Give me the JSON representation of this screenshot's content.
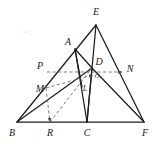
{
  "figure": {
    "width": 161,
    "height": 151,
    "background_color": "#ffffff",
    "stroke_color": "#1c1c1c",
    "dashed_color": "#6d6d6d",
    "points": {
      "E": {
        "label": "E",
        "x": 96,
        "y": 25,
        "label_x": 96,
        "label_y": 12
      },
      "A": {
        "label": "A",
        "x": 75,
        "y": 49,
        "label_x": 68,
        "label_y": 42
      },
      "D": {
        "label": "D",
        "x": 92,
        "y": 68,
        "label_x": 99,
        "label_y": 62
      },
      "O": {
        "label": "O",
        "x": 93,
        "y": 75,
        "label_x": 97,
        "label_y": 76
      },
      "N": {
        "label": "N",
        "x": 122,
        "y": 72,
        "label_x": 130,
        "label_y": 69
      },
      "P": {
        "label": "P",
        "x": 47,
        "y": 72,
        "label_x": 40,
        "label_y": 66
      },
      "M": {
        "label": "M",
        "x": 46,
        "y": 88,
        "label_x": 40,
        "label_y": 89
      },
      "L": {
        "label": "L",
        "x": 82,
        "y": 87,
        "label_x": 85,
        "label_y": 89
      },
      "B": {
        "label": "B",
        "x": 17,
        "y": 122,
        "label_x": 12,
        "label_y": 133
      },
      "R": {
        "label": "R",
        "x": 50,
        "y": 122,
        "label_x": 50,
        "label_y": 133
      },
      "C": {
        "label": "C",
        "x": 87,
        "y": 122,
        "label_x": 87,
        "label_y": 133
      },
      "F": {
        "label": "F",
        "x": 144,
        "y": 122,
        "label_x": 145,
        "label_y": 133
      }
    },
    "solid_segments": [
      {
        "name": "segment-B-E",
        "from": "B",
        "to": "E"
      },
      {
        "name": "segment-E-F",
        "from": "E",
        "to": "F"
      },
      {
        "name": "segment-B-F",
        "from": "B",
        "to": "F"
      },
      {
        "name": "segment-E-C",
        "from": "E",
        "to": "C"
      },
      {
        "name": "segment-A-C",
        "from": "A",
        "to": "C"
      },
      {
        "name": "segment-A-D",
        "from": "A",
        "to": "D"
      },
      {
        "name": "segment-D-C",
        "from": "D",
        "to": "C"
      },
      {
        "name": "segment-D-F",
        "from": "D",
        "to": "F"
      },
      {
        "name": "segment-B-D",
        "from": "B",
        "to": "D"
      },
      {
        "name": "segment-A-L",
        "from": "A",
        "to": "L"
      }
    ],
    "dashed_segments": [
      {
        "name": "dashed-P-to-N-arrow",
        "from": "P",
        "to": "N",
        "arrow": true
      },
      {
        "name": "dashed-M-to-R-arrow",
        "from": "M",
        "to": "R",
        "arrow": true
      },
      {
        "name": "dashed-M-to-O-arrow",
        "from": "M",
        "to": "O",
        "arrow": true
      },
      {
        "name": "dashed-R-to-D",
        "from": "R",
        "to": "D",
        "arrow": false
      }
    ]
  }
}
